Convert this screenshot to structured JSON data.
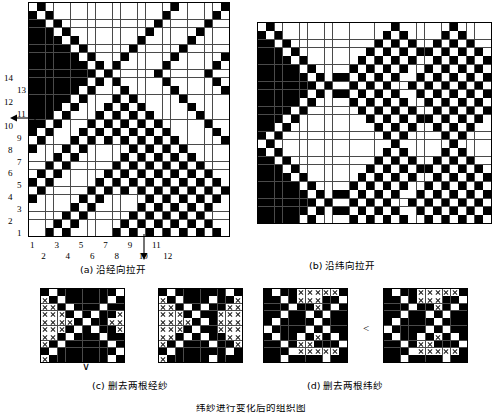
{
  "page": {
    "bottom_note": "纬纱进行变化后的组织图"
  },
  "figures": [
    {
      "id": "a",
      "caption": "(a) 沿经向拉开",
      "cols": 24,
      "rows": 28,
      "x_axis_labels_top": [
        "1",
        "3",
        "5",
        "7",
        "9",
        "11"
      ],
      "x_axis_labels_bottom": [
        "2",
        "4",
        "6",
        "8",
        "10",
        "12"
      ],
      "y_axis_labels_outer": [
        "2",
        "4",
        "6",
        "8",
        "10",
        "12",
        "14"
      ],
      "y_axis_labels_inner": [
        "1",
        "3",
        "5",
        "7",
        "9",
        "11",
        "13"
      ],
      "has_x_arrow": true,
      "has_y_arrow": true,
      "rows_data": [
        "101111111111111110111110",
        "010111111111111101111101",
        "001011111111111011111011",
        "000101111111110111110111",
        "000010111111101111101111",
        "000001011111011111011111",
        "000000101110111110111110",
        "000000010101111101111101",
        "000000001011111011111011",
        "000000010101111101111101",
        "000000101110111110111110",
        "000001011101011111011111",
        "000010111010101111101111",
        "000101110101010111110111",
        "001011101010101011111011",
        "010111010101010101111101",
        "101110101010101010111110",
        "011101011111010101011111",
        "111010111110101010101111",
        "110101111101010101010111",
        "101011111010101010101011",
        "010111110101010101010101",
        "101111101010101010101010",
        "011111010111110101010101",
        "111110101111101010101011",
        "111101011111010101010111",
        "111010111110101010101011",
        "110101111101010101010101"
      ]
    },
    {
      "id": "b",
      "caption": "(b) 沿纬向拉开",
      "cols": 28,
      "rows": 24,
      "rows_data": [
        "1011111111111111011111101111",
        "0101111111111110101111010111",
        "0010111111111101010110101011",
        "0001011111111010101001010101",
        "0000101111110101010110101010",
        "0000010111101010101101010101",
        "0000001010010101011010101010",
        "0000000101101010110101010101",
        "0000001010010101011010101010",
        "0000010111101010101101010101",
        "0000101111110101010110101010",
        "0001011111111010101001010101",
        "0010111111111101010110101011",
        "0101111111111110101111010111",
        "1011111111111111011111101111",
        "0101111111111110101111010111",
        "0010111111111101010110101011",
        "0001011111111010101001010101",
        "0000101111110101010110101010",
        "0000010111101010101101010101",
        "0000001010010101011010101010",
        "0000000101101010110101010101",
        "0000001010010101011010101010",
        "0000010111101010101101010101"
      ]
    },
    {
      "id": "c",
      "caption": "(c) 删去两根经纱",
      "sub": [
        {
          "cols": 10,
          "rows": 10,
          "rows_data": [
            "0100000001",
            "2010000010",
            "2201000100",
            "2220101002",
            "2222010022",
            "2220101002",
            "2201000100",
            "2010000010",
            "0100000001",
            "2000000010"
          ]
        },
        {
          "cols": 10,
          "rows": 10,
          "rows_data": [
            "0100000010",
            "2010001002",
            "2201010022",
            "2220100222",
            "2222010222",
            "2220100222",
            "2201010022",
            "2010001002",
            "0100000010",
            "2000001000"
          ]
        }
      ],
      "marker": "∨"
    },
    {
      "id": "d",
      "caption": "(d) 删去两根纬纱",
      "sub": [
        {
          "cols": 10,
          "rows": 10,
          "rows_data": [
            "0100222220",
            "0010222001",
            "0001002010",
            "0010010100",
            "0100001000",
            "1000010100",
            "0100102010",
            "0010220001",
            "0001222220",
            "0010000100"
          ]
        },
        {
          "cols": 10,
          "rows": 10,
          "rows_data": [
            "0100222220",
            "0010222001",
            "0001002010",
            "0010010100",
            "0100001000",
            "1000010100",
            "0100102010",
            "0010220001",
            "0001222220",
            "0010000100"
          ]
        }
      ],
      "marker": "<"
    }
  ]
}
